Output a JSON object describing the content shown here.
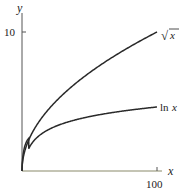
{
  "chart_data": {
    "type": "line",
    "title": "",
    "xlabel": "x",
    "ylabel": "y",
    "xlim": [
      0,
      100
    ],
    "ylim": [
      0,
      11
    ],
    "x_ticks": [
      {
        "value": 100,
        "label": "100"
      }
    ],
    "y_ticks": [
      {
        "value": 10,
        "label": "10"
      }
    ],
    "grid": false,
    "legend": "inline curve labels at right end",
    "series": [
      {
        "name": "sqrt(x)",
        "label": "√x",
        "x": [
          0,
          1,
          4,
          9,
          16,
          25,
          36,
          49,
          64,
          81,
          100
        ],
        "values": [
          0,
          1,
          2,
          3,
          4,
          5,
          6,
          7,
          8,
          9,
          10
        ]
      },
      {
        "name": "ln(x)",
        "label": "ln x",
        "x": [
          1,
          5,
          10,
          20,
          40,
          60,
          80,
          100
        ],
        "values": [
          0,
          1.61,
          2.3,
          3.0,
          3.69,
          4.09,
          4.38,
          4.61
        ]
      }
    ]
  },
  "labels": {
    "x_axis": "x",
    "y_axis": "y",
    "y_tick_10": "10",
    "x_tick_100": "100",
    "sqrt_label_radical": "√",
    "sqrt_label_var": "x",
    "ln_label_fn": "ln",
    "ln_label_var": "x"
  }
}
